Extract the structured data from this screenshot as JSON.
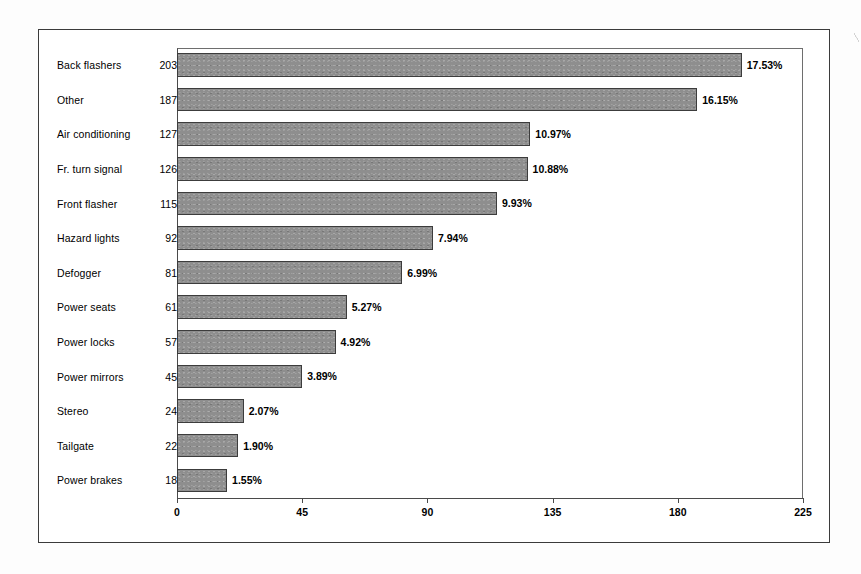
{
  "chart_data": {
    "type": "bar",
    "orientation": "horizontal",
    "title": "",
    "subtitle": "",
    "xlabel": "",
    "ylabel": "",
    "xlim": [
      0,
      225
    ],
    "xticks": [
      0,
      45,
      90,
      135,
      180,
      225
    ],
    "xtick_labels": [
      "0",
      "45",
      "90",
      "135",
      "180",
      "225"
    ],
    "grid": false,
    "legend": null,
    "bar_color": "#8e8e8e",
    "bar_border_color": "#3c3c3c",
    "frame_color": "#3b3b3b",
    "categories": [
      "Back flashers",
      "Other",
      "Air conditioning",
      "Fr. turn signal",
      "Front flasher",
      "Hazard lights",
      "Defogger",
      "Power seats",
      "Power locks",
      "Power mirrors",
      "Stereo",
      "Tailgate",
      "Power brakes"
    ],
    "values": [
      203,
      187,
      127,
      126,
      115,
      92,
      81,
      61,
      57,
      45,
      24,
      22,
      18
    ],
    "value_labels": [
      "203",
      "187",
      "127",
      "126",
      "115",
      "92",
      "81",
      "61",
      "57",
      "45",
      "24",
      "22",
      "18"
    ],
    "data_labels": [
      "17.53%",
      "16.15%",
      "10.97%",
      "10.88%",
      "9.93%",
      "7.94%",
      "6.99%",
      "5.27%",
      "4.92%",
      "3.89%",
      "2.07%",
      "1.90%",
      "1.55%"
    ],
    "percentages": [
      17.53,
      16.15,
      10.97,
      10.88,
      9.93,
      7.94,
      6.99,
      5.27,
      4.92,
      3.89,
      2.07,
      1.9,
      1.55
    ],
    "rows": [
      {
        "category": "Back flashers",
        "value": 203,
        "value_label": "203",
        "pct_label": "17.53%"
      },
      {
        "category": "Other",
        "value": 187,
        "value_label": "187",
        "pct_label": "16.15%"
      },
      {
        "category": "Air conditioning",
        "value": 127,
        "value_label": "127",
        "pct_label": "10.97%"
      },
      {
        "category": "Fr. turn signal",
        "value": 126,
        "value_label": "126",
        "pct_label": "10.88%"
      },
      {
        "category": "Front flasher",
        "value": 115,
        "value_label": "115",
        "pct_label": "9.93%"
      },
      {
        "category": "Hazard lights",
        "value": 92,
        "value_label": "92",
        "pct_label": "7.94%"
      },
      {
        "category": "Defogger",
        "value": 81,
        "value_label": "81",
        "pct_label": "6.99%"
      },
      {
        "category": "Power seats",
        "value": 61,
        "value_label": "61",
        "pct_label": "5.27%"
      },
      {
        "category": "Power locks",
        "value": 57,
        "value_label": "57",
        "pct_label": "4.92%"
      },
      {
        "category": "Power mirrors",
        "value": 45,
        "value_label": "45",
        "pct_label": "3.89%"
      },
      {
        "category": "Stereo",
        "value": 24,
        "value_label": "24",
        "pct_label": "2.07%"
      },
      {
        "category": "Tailgate",
        "value": 22,
        "value_label": "22",
        "pct_label": "1.90%"
      },
      {
        "category": "Power brakes",
        "value": 18,
        "value_label": "18",
        "pct_label": "1.55%"
      }
    ]
  }
}
